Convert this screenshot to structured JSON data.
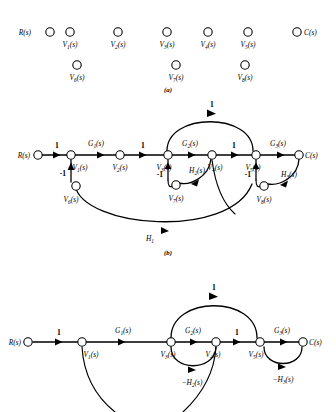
{
  "figure": {
    "background_color": "#ffffff",
    "ink_color": "#000000",
    "panels": [
      {
        "id": "a",
        "caption": "(a)"
      },
      {
        "id": "b",
        "caption": "(b)"
      },
      {
        "id": "c",
        "caption": "(c)"
      }
    ]
  },
  "panel_a": {
    "caption": "(a)",
    "description": "Isolated nodes with variable labels, no branches",
    "nodes": [
      {
        "name": "R",
        "label": "R(s)",
        "base": "R",
        "sub": "",
        "x": 50,
        "y": 32,
        "label_pos": "left"
      },
      {
        "name": "V1",
        "label": "V1(s)",
        "base": "V",
        "sub": "1",
        "x": 70,
        "y": 32,
        "label_pos": "below"
      },
      {
        "name": "V2",
        "label": "V2(s)",
        "base": "V",
        "sub": "2",
        "x": 118,
        "y": 32,
        "label_pos": "below"
      },
      {
        "name": "V3",
        "label": "V3(s)",
        "base": "V",
        "sub": "3",
        "x": 167,
        "y": 32,
        "label_pos": "below"
      },
      {
        "name": "V4",
        "label": "V4(s)",
        "base": "V",
        "sub": "4",
        "x": 208,
        "y": 32,
        "label_pos": "below"
      },
      {
        "name": "V5",
        "label": "V5(s)",
        "base": "V",
        "sub": "5",
        "x": 248,
        "y": 32,
        "label_pos": "below"
      },
      {
        "name": "C",
        "label": "C(s)",
        "base": "C",
        "sub": "",
        "x": 297,
        "y": 32,
        "label_pos": "right"
      },
      {
        "name": "V6",
        "label": "V6(s)",
        "base": "V",
        "sub": "6",
        "x": 77,
        "y": 65,
        "label_pos": "below"
      },
      {
        "name": "V7",
        "label": "V7(s)",
        "base": "V",
        "sub": "7",
        "x": 176,
        "y": 65,
        "label_pos": "below"
      },
      {
        "name": "V8",
        "label": "V8(s)",
        "base": "V",
        "sub": "8",
        "x": 245,
        "y": 65,
        "label_pos": "below"
      }
    ]
  },
  "panel_b": {
    "caption": "(b)",
    "description": "Complete signal flow graph with all branches and gains",
    "nodes": [
      {
        "name": "R",
        "label": "R(s)",
        "base": "R",
        "sub": ""
      },
      {
        "name": "V1",
        "label": "V1(s)",
        "base": "V",
        "sub": "1"
      },
      {
        "name": "V2",
        "label": "V2(s)",
        "base": "V",
        "sub": "2"
      },
      {
        "name": "V3",
        "label": "V3(s)",
        "base": "V",
        "sub": "3"
      },
      {
        "name": "V4",
        "label": "V4(s)",
        "base": "V",
        "sub": "4"
      },
      {
        "name": "V5",
        "label": "V5(s)",
        "base": "V",
        "sub": "5"
      },
      {
        "name": "C",
        "label": "C(s)",
        "base": "C",
        "sub": ""
      },
      {
        "name": "V6",
        "label": "V6(s)",
        "base": "V",
        "sub": "6"
      },
      {
        "name": "V7",
        "label": "V7(s)",
        "base": "V",
        "sub": "7"
      },
      {
        "name": "V8",
        "label": "V8(s)",
        "base": "V",
        "sub": "8"
      }
    ],
    "branch_gains": {
      "r_to_v1": "1",
      "v1_to_v2": "G1(s)",
      "v2_to_v3": "1",
      "v3_to_v4": "G2(s)",
      "v4_to_v5": "1",
      "v5_to_c": "G3(s)",
      "v6_to_v1": "-1",
      "v7_to_v3": "-1",
      "v8_to_v5": "-1",
      "v4_to_v7": "H2(s)",
      "c_to_v8": "H3(s)",
      "v4_to_v3_feedforward": "1",
      "c_to_v6": "H1"
    }
  },
  "panel_c": {
    "caption": "(c)",
    "description": "Reduced signal flow graph after eliminating V2, V6, V7, V8",
    "nodes": [
      {
        "name": "R",
        "label": "R(s)",
        "base": "R",
        "sub": ""
      },
      {
        "name": "V1",
        "label": "V1(s)",
        "base": "V",
        "sub": "1"
      },
      {
        "name": "V3",
        "label": "V3(s)",
        "base": "V",
        "sub": "3"
      },
      {
        "name": "V4",
        "label": "V4(s)",
        "base": "V",
        "sub": "4"
      },
      {
        "name": "V5",
        "label": "V5(s)",
        "base": "V",
        "sub": "5"
      },
      {
        "name": "C",
        "label": "C(s)",
        "base": "C",
        "sub": ""
      }
    ],
    "branch_gains": {
      "r_to_v1": "1",
      "v1_to_v3": "G1(s)",
      "v3_to_v4": "G2(s)",
      "v4_to_v5": "1",
      "v5_to_c": "G3(s)",
      "v4_to_v3_feedback": "-H2(s)",
      "c_to_v5_feedback": "-H3(s)",
      "v4_to_v3_feedforward": "1"
    }
  }
}
